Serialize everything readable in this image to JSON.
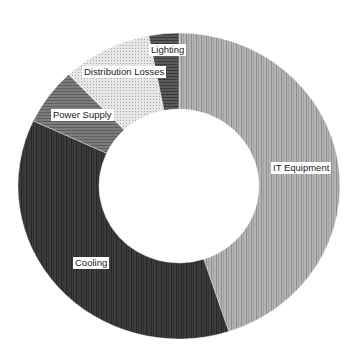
{
  "chart_data": {
    "type": "pie",
    "subtype": "donut",
    "title": "",
    "start_angle_deg": 0,
    "direction": "clockwise",
    "legend": "none (data labels on slices)",
    "categories": [
      "IT Equipment",
      "Cooling",
      "Power Supply",
      "Distribution Losses",
      "Lighting"
    ],
    "values": [
      45,
      37,
      6,
      9,
      3
    ],
    "unit": "percent (estimated from slice angles)",
    "slices": [
      {
        "label": "IT Equipment",
        "value": 45,
        "fill": "#b4b4b4",
        "pattern": "vertical-stripes",
        "stripe": "#8e8e8e",
        "label_pos": {
          "x": 271,
          "y": 162
        }
      },
      {
        "label": "Cooling",
        "value": 37,
        "fill": "#3c3c3c",
        "pattern": "vertical-stripes",
        "stripe": "#262626",
        "label_pos": {
          "x": 73,
          "y": 257
        }
      },
      {
        "label": "Power Supply",
        "value": 6,
        "fill": "#7c7c7c",
        "pattern": "horizontal-stripes",
        "stripe": "#5e5e5e",
        "label_pos": {
          "x": 51,
          "y": 109
        }
      },
      {
        "label": "Distribution Losses",
        "value": 9,
        "fill": "#e6e6e6",
        "pattern": "dots",
        "stripe": "#a8a8a8",
        "label_pos": {
          "x": 82,
          "y": 66
        }
      },
      {
        "label": "Lighting",
        "value": 3,
        "fill": "#5a5a5a",
        "pattern": "horizontal-stripes",
        "stripe": "#3a3a3a",
        "label_pos": {
          "x": 149,
          "y": 44
        }
      }
    ],
    "geometry": {
      "cx": 179,
      "cy": 186,
      "rx_outer": 161,
      "ry_outer": 153,
      "rx_inner": 80,
      "ry_inner": 77
    }
  }
}
